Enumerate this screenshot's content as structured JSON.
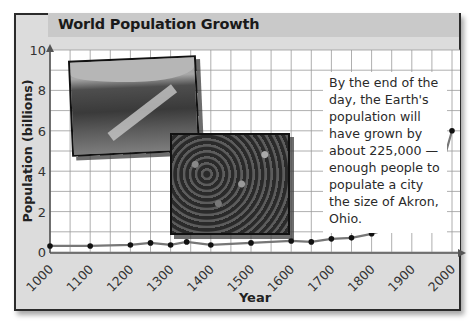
{
  "title": "World Population Growth",
  "caption": "By the end of the day, the Earth's population will have grown by about 225,000 — enough people to populate a city the size of Akron, Ohio.",
  "photos": [
    {
      "name": "hills-landscape-photo"
    },
    {
      "name": "crowd-photo"
    }
  ],
  "chart_data": {
    "type": "line",
    "title": "World Population Growth",
    "xlabel": "Year",
    "ylabel": "Population (billions)",
    "xlim": [
      1000,
      2000
    ],
    "ylim": [
      0,
      10
    ],
    "grid": true,
    "x_ticks": [
      "1000",
      "1100",
      "1200",
      "1300",
      "1400",
      "1500",
      "1600",
      "1700",
      "1800",
      "1900",
      "2000"
    ],
    "y_ticks": [
      "0",
      "2",
      "4",
      "6",
      "8",
      "10"
    ],
    "x": [
      1000,
      1100,
      1200,
      1250,
      1300,
      1340,
      1400,
      1500,
      1600,
      1650,
      1700,
      1750,
      1800,
      1850,
      1900,
      1950,
      2000
    ],
    "values": [
      0.3,
      0.3,
      0.35,
      0.45,
      0.35,
      0.5,
      0.35,
      0.45,
      0.55,
      0.5,
      0.65,
      0.7,
      0.9,
      1.2,
      1.6,
      2.5,
      6.0
    ]
  }
}
